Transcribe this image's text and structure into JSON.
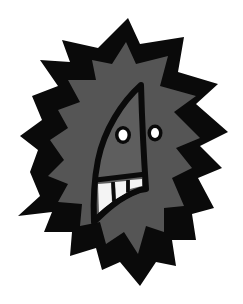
{
  "image": {
    "description": "Cartoon illustration of a spiky starburst-shaped creature with a triangular nose-face, two round eyes and three teeth",
    "width": 243,
    "height": 304
  },
  "colors": {
    "background": "#ffffff",
    "outer_burst": "#0a0a0a",
    "inner_burst": "#555555",
    "face": "#5e5e5e",
    "outline": "#0a0a0a",
    "eye_white": "#ffffff",
    "teeth": "#f4f4f4"
  },
  "figure": {
    "outer_burst_label": "outer black spiky burst",
    "inner_burst_label": "inner gray spiky burst",
    "face_label": "triangular face",
    "eyes_count": 2,
    "teeth_count": 3
  }
}
